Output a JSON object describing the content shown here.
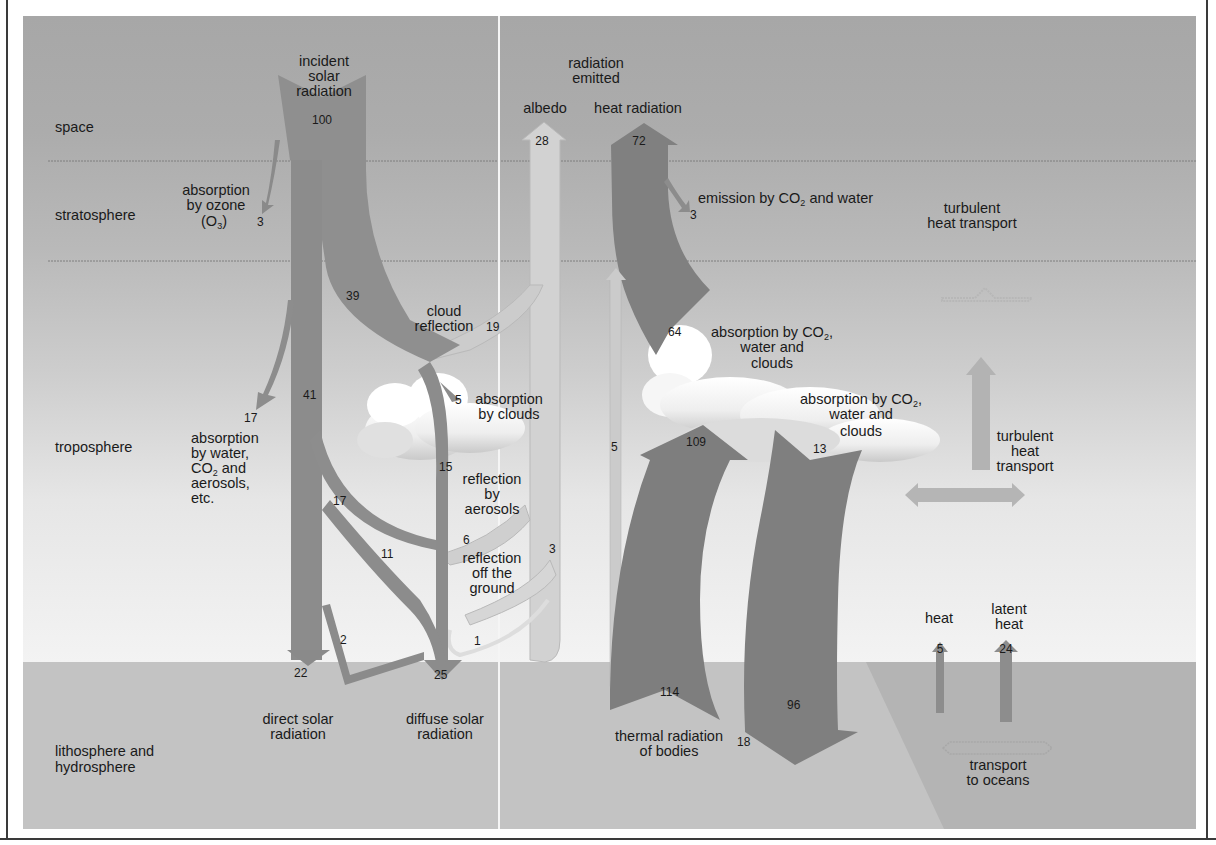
{
  "layers": {
    "space": "space",
    "stratosphere": "stratosphere",
    "troposphere": "troposphere",
    "lithosphere_line1": "lithosphere and",
    "lithosphere_line2": "hydrosphere"
  },
  "incident": {
    "line1": "incident",
    "line2": "solar",
    "line3": "radiation",
    "value": "100"
  },
  "ozone": {
    "line1": "absorption",
    "line2": "by ozone",
    "line3": "(O",
    "line3_sub": "3",
    "line3_end": ")",
    "value": "3"
  },
  "emitted": {
    "line1": "radiation",
    "line2": "emitted",
    "albedo_label": "albedo",
    "albedo_value": "28",
    "heat_label": "heat radiation",
    "heat_value": "72"
  },
  "emission_co2": {
    "text_pre": "emission by CO",
    "text_sub": "2",
    "text_post": " and water",
    "value": "3"
  },
  "turbulent_strat": {
    "line1": "turbulent",
    "line2": "heat transport"
  },
  "cloud_reflection": {
    "line1": "cloud",
    "line2": "reflection",
    "value": "19"
  },
  "flows": {
    "scattered": "39",
    "direct_upper": "41",
    "tropo_absorption": "17",
    "cloud_absorption": "5",
    "diffuse_through_cloud": "15",
    "scattered_lower": "17",
    "aerosol_reflection": "6",
    "scattered_to_ground": "11",
    "ground_reflection": "3",
    "direct_to_diffuse": "2",
    "ground_reflection_small": "1",
    "direct_ground": "22",
    "diffuse_ground": "25"
  },
  "tropo_absorption_label": {
    "line1": "absorption",
    "line2": "by water,",
    "line3_pre": "CO",
    "line3_sub": "2",
    "line3_post": " and",
    "line4": "aerosols,",
    "line5": "etc."
  },
  "cloud_absorption_label": {
    "line1": "absorption",
    "line2": "by clouds"
  },
  "aerosol_label": {
    "line1": "reflection",
    "line2": "by",
    "line3": "aerosols"
  },
  "ground_label": {
    "line1": "reflection",
    "line2": "off the",
    "line3": "ground"
  },
  "direct_label": {
    "line1": "direct solar",
    "line2": "radiation"
  },
  "diffuse_label": {
    "line1": "diffuse solar",
    "line2": "radiation"
  },
  "thermal": {
    "upward_small": "5",
    "absorption_upper_value": "64",
    "absorption_upper_l1_pre": "absorption by CO",
    "absorption_upper_l1_sub": "2",
    "absorption_upper_l1_post": ",",
    "absorption_upper_l2": "water and",
    "absorption_upper_l3": "clouds",
    "absorption_lower_l1_pre": "absorption by CO",
    "absorption_lower_l1_sub": "2",
    "absorption_lower_l1_post": ",",
    "absorption_lower_l2": "water and",
    "absorption_lower_l3": "clouds",
    "ground_to_cloud": "109",
    "cloud_loss": "13",
    "ground_emission": "114",
    "back_radiation": "96",
    "bodies_line1": "thermal radiation",
    "bodies_line2": "of bodies",
    "bodies_value": "18"
  },
  "turbulent_tropo": {
    "line1": "turbulent",
    "line2": "heat",
    "line3": "transport"
  },
  "surface_flux": {
    "heat_label": "heat",
    "heat_value": "5",
    "latent_line1": "latent",
    "latent_line2": "heat",
    "latent_value": "24",
    "transport_line1": "transport",
    "transport_line2": "to oceans"
  },
  "colors": {
    "space_band": "#a9a9a9",
    "ground_band": "#c2c2c2",
    "solar_arrow": "#8c8c8c",
    "reflected_arrow": "#cfcfcf",
    "thermal_arrow": "#7c7c7c",
    "cloud": "#f4f4f4"
  }
}
